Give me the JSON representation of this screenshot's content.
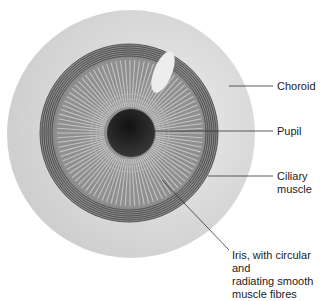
{
  "diagram": {
    "colors": {
      "choroid": "#d2d2d2",
      "ring_band": "#7a7a7a",
      "ring_lines": "#4a4a4a",
      "iris": "#8c8c8c",
      "iris_fibres": "#c8c8c8",
      "pupil": "#1a1a1a",
      "highlight": "#eeeeee",
      "leader": "#333333"
    },
    "labels": [
      {
        "id": "choroid",
        "lines": [
          "Choroid"
        ]
      },
      {
        "id": "pupil",
        "lines": [
          "Pupil"
        ]
      },
      {
        "id": "ciliary",
        "lines": [
          "Ciliary",
          "muscle"
        ]
      },
      {
        "id": "iris",
        "lines": [
          "Iris, with circular and",
          "radiating smooth",
          "muscle fibres"
        ]
      }
    ]
  }
}
